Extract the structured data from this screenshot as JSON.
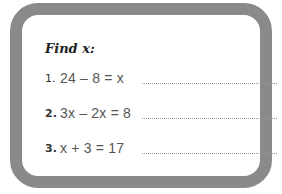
{
  "worksheet": {
    "title": "Find x:",
    "problems": [
      {
        "number": "1.",
        "equation": "24 – 8 = x"
      },
      {
        "number": "2.",
        "equation": "3x – 2x = 8"
      },
      {
        "number": "3.",
        "equation": "x + 3 = 17"
      }
    ]
  },
  "colors": {
    "border": "#8a8a8a",
    "text": "#555555",
    "title": "#222222"
  }
}
